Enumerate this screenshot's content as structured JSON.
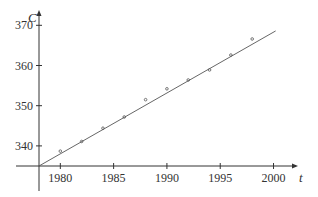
{
  "chart_data": {
    "type": "scatter",
    "title": "",
    "xlabel": "t",
    "ylabel": "C",
    "x_ticks": [
      1980,
      1985,
      1990,
      1995,
      2000
    ],
    "y_ticks": [
      340,
      350,
      360,
      370
    ],
    "xlim": [
      1978,
      2003
    ],
    "ylim": [
      335,
      372
    ],
    "grid": false,
    "legend": null,
    "series": [
      {
        "name": "data points",
        "kind": "scatter",
        "x": [
          1980,
          1982,
          1984,
          1986,
          1988,
          1990,
          1992,
          1994,
          1996,
          1998
        ],
        "y": [
          338.7,
          341.1,
          344.4,
          347.2,
          351.5,
          354.2,
          356.4,
          358.9,
          362.6,
          366.6
        ]
      },
      {
        "name": "regression line",
        "kind": "line",
        "x": [
          1978,
          2000.2
        ],
        "y": [
          335,
          368.6
        ]
      }
    ]
  },
  "axes": {
    "x_label": "t",
    "y_label": "C",
    "x_tick_labels": [
      "1980",
      "1985",
      "1990",
      "1995",
      "2000"
    ],
    "y_tick_labels": [
      "340",
      "350",
      "360",
      "370"
    ]
  },
  "colors": {
    "axis": "#333333",
    "line": "#555555",
    "points": "#555555",
    "text": "#333333"
  }
}
